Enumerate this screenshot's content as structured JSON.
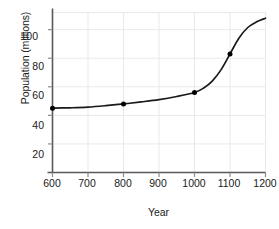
{
  "chart_data": {
    "type": "line",
    "title": "",
    "subtitle": "",
    "xlabel": "Year",
    "ylabel": "Population (millions)",
    "xlim": [
      600,
      1200
    ],
    "ylim": [
      0,
      112
    ],
    "xticks": [
      600,
      700,
      800,
      900,
      1000,
      1100,
      1200
    ],
    "xtick_labels": [
      "600",
      "700",
      "800",
      "900",
      "1000",
      "1100",
      "1200"
    ],
    "yticks": [
      20,
      40,
      60,
      80,
      100
    ],
    "ytick_labels": [
      "20",
      "40",
      "60",
      "80",
      "100"
    ],
    "grid": true,
    "legend": null,
    "legend_position": "none",
    "annotations": [],
    "series": [
      {
        "name": "Population",
        "marker": "circle",
        "line_color": "#1a1a1a",
        "marker_color": "#000000",
        "x": [
          600,
          800,
          1000,
          1100
        ],
        "values": [
          45,
          48,
          56,
          83
        ],
        "curve_x": [
          600,
          650,
          700,
          750,
          800,
          850,
          900,
          950,
          1000,
          1025,
          1050,
          1075,
          1100,
          1125,
          1150,
          1175,
          1200
        ],
        "curve_values": [
          45,
          45.3,
          45.8,
          46.8,
          48,
          49.4,
          51,
          53.2,
          56,
          59,
          64,
          72,
          83,
          94,
          101.5,
          105.5,
          108
        ]
      }
    ]
  },
  "axes": {
    "x_axis_color": "#595959",
    "y_axis_color": "#595959",
    "grid_color": "#e9e9e9",
    "tick_color": "#8c8c8c"
  }
}
